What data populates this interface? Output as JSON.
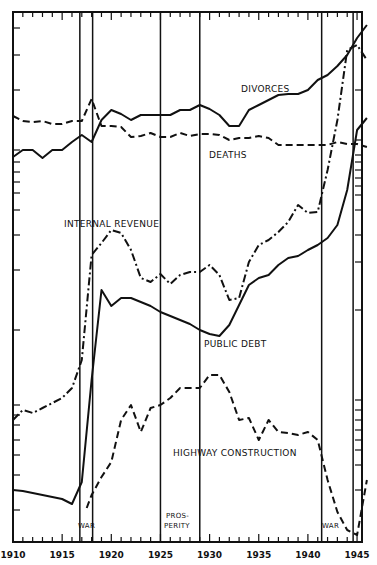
{
  "chart_data": {
    "type": "line",
    "title": "",
    "xlabel": "",
    "ylabel": "",
    "xlim": [
      1910,
      1946
    ],
    "x_tick_labels": [
      "1910",
      "1915",
      "1920",
      "1925",
      "1930",
      "1935",
      "1940",
      "1945"
    ],
    "grid": false,
    "legend": "inline labels",
    "annotations": [
      {
        "text": "WAR",
        "x": 1917.5,
        "note": "between vertical lines ~1917 and ~1918.5"
      },
      {
        "text": "PROS-",
        "x": 1927,
        "note": "first line of PROSPERITY label, between 1925 and 1929"
      },
      {
        "text": "PERITY",
        "x": 1927
      },
      {
        "text": "WAR",
        "x": 1943,
        "note": "between vertical lines ~1941.5 and ~1945"
      }
    ],
    "vertical_lines": [
      1916.8,
      1918.1,
      1925,
      1929,
      1941.4,
      1944.6
    ],
    "series": [
      {
        "name": "DIVORCES",
        "style": "solid",
        "x": [
          1910,
          1911,
          1912,
          1913,
          1914,
          1915,
          1916,
          1917,
          1918,
          1919,
          1920,
          1921,
          1922,
          1923,
          1924,
          1925,
          1926,
          1927,
          1928,
          1929,
          1930,
          1931,
          1932,
          1933,
          1934,
          1935,
          1936,
          1937,
          1938,
          1939,
          1940,
          1941,
          1942,
          1943,
          1944,
          1945,
          1946
        ],
        "pixel_y": [
          157,
          150,
          150,
          158,
          150,
          150,
          142,
          135,
          142,
          120,
          110,
          114,
          120,
          115,
          115,
          115,
          115,
          110,
          110,
          105,
          109,
          115,
          126,
          126,
          110,
          105,
          100,
          95,
          94,
          94,
          90,
          80,
          75,
          66,
          55,
          38,
          25
        ]
      },
      {
        "name": "DEATHS",
        "style": "dashed",
        "x": [
          1910,
          1911,
          1912,
          1913,
          1914,
          1915,
          1916,
          1917,
          1918,
          1919,
          1920,
          1921,
          1922,
          1923,
          1924,
          1925,
          1926,
          1927,
          1928,
          1929,
          1930,
          1931,
          1932,
          1933,
          1934,
          1935,
          1936,
          1937,
          1938,
          1939,
          1940,
          1941,
          1942,
          1943,
          1944,
          1945,
          1946
        ],
        "pixel_y": [
          116,
          121,
          122,
          121,
          124,
          124,
          121,
          121,
          99,
          126,
          126,
          127,
          137,
          136,
          133,
          137,
          137,
          133,
          136,
          134,
          134,
          135,
          140,
          138,
          138,
          136,
          138,
          145,
          145,
          145,
          145,
          145,
          145,
          142,
          144,
          144,
          147
        ]
      },
      {
        "name": "INTERNAL REVENUE",
        "style": "dash-dot",
        "x": [
          1910,
          1911,
          1912,
          1913,
          1914,
          1915,
          1916,
          1917,
          1918,
          1919,
          1920,
          1921,
          1922,
          1923,
          1924,
          1925,
          1926,
          1927,
          1928,
          1929,
          1930,
          1931,
          1932,
          1933,
          1934,
          1935,
          1936,
          1937,
          1938,
          1939,
          1940,
          1941,
          1942,
          1943,
          1944,
          1945,
          1946
        ],
        "pixel_y": [
          420,
          410,
          413,
          408,
          403,
          398,
          388,
          360,
          255,
          243,
          230,
          233,
          250,
          278,
          282,
          274,
          284,
          275,
          272,
          272,
          265,
          275,
          300,
          298,
          262,
          245,
          240,
          232,
          222,
          205,
          213,
          212,
          170,
          120,
          50,
          45,
          60
        ]
      },
      {
        "name": "PUBLIC DEBT",
        "style": "solid",
        "x": [
          1910,
          1911,
          1912,
          1913,
          1914,
          1915,
          1916,
          1917,
          1918,
          1919,
          1920,
          1921,
          1922,
          1923,
          1924,
          1925,
          1926,
          1927,
          1928,
          1929,
          1930,
          1931,
          1932,
          1933,
          1934,
          1935,
          1936,
          1937,
          1938,
          1939,
          1940,
          1941,
          1942,
          1943,
          1944,
          1945,
          1946
        ],
        "pixel_y": [
          490,
          491,
          493,
          495,
          497,
          499,
          504,
          482,
          380,
          290,
          306,
          298,
          298,
          302,
          306,
          312,
          316,
          320,
          324,
          330,
          334,
          336,
          325,
          305,
          285,
          278,
          275,
          265,
          258,
          256,
          250,
          245,
          238,
          225,
          190,
          130,
          118
        ]
      },
      {
        "name": "HIGHWAY CONSTRUCTION",
        "style": "dashed",
        "x": [
          1917.5,
          1918,
          1919,
          1920,
          1921,
          1922,
          1923,
          1924,
          1925,
          1926,
          1927,
          1928,
          1929,
          1930,
          1931,
          1932,
          1933,
          1934,
          1935,
          1936,
          1937,
          1938,
          1939,
          1940,
          1941,
          1942,
          1943,
          1944,
          1945,
          1946
        ],
        "pixel_y": [
          508,
          495,
          477,
          462,
          420,
          405,
          432,
          408,
          405,
          398,
          388,
          388,
          388,
          375,
          375,
          392,
          420,
          418,
          440,
          420,
          432,
          433,
          435,
          432,
          440,
          480,
          512,
          530,
          535,
          480
        ]
      }
    ],
    "labels": {
      "divorces": "DIVORCES",
      "deaths": "DEATHS",
      "internal_revenue": "INTERNAL  REVENUE",
      "public_debt": "PUBLIC  DEBT",
      "highway": "HIGHWAY  CONSTRUCTION",
      "war1": "WAR",
      "pros1": "PROS-",
      "pros2": "PERITY",
      "war2": "WAR"
    }
  }
}
